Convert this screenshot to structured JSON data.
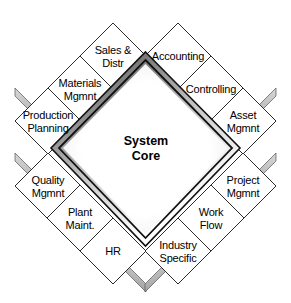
{
  "diagram": {
    "type": "diamond-module-map",
    "core": {
      "label": "System\nCore",
      "line1": "System",
      "line2": "Core"
    },
    "colors": {
      "tile_fill": "#ffffff",
      "tile_stroke": "#2b2b2b",
      "extrusion_light": "#c8c8c8",
      "extrusion_dark": "#8a8a8a",
      "core_border_dark": "#1a1a1a",
      "core_bevel_gray": "#6e6e6e",
      "core_fill": "#ffffff",
      "text": "#000000",
      "background": "#ffffff"
    },
    "modules": [
      {
        "id": "sales-distr",
        "label": "Sales &\nDistr",
        "cx": 113,
        "cy": 56,
        "position": "top-left"
      },
      {
        "id": "accounting",
        "label": "Accounting",
        "cx": 178,
        "cy": 56,
        "position": "top-right"
      },
      {
        "id": "materials-mgmnt",
        "label": "Materials\nMgmnt",
        "cx": 80,
        "cy": 89,
        "position": "upper-left"
      },
      {
        "id": "controlling",
        "label": "Controlling",
        "cx": 211,
        "cy": 89,
        "position": "upper-right"
      },
      {
        "id": "production-planning",
        "label": "Production\nPlanning",
        "cx": 48,
        "cy": 121,
        "position": "left-upper"
      },
      {
        "id": "asset-mgmnt",
        "label": "Asset\nMgmnt",
        "cx": 243,
        "cy": 121,
        "position": "right-upper"
      },
      {
        "id": "quality-mgmnt",
        "label": "Quality\nMgmnt",
        "cx": 48,
        "cy": 186,
        "position": "left-lower"
      },
      {
        "id": "project-mgmnt",
        "label": "Project\nMgmnt",
        "cx": 243,
        "cy": 186,
        "position": "right-lower"
      },
      {
        "id": "plant-maint",
        "label": "Plant\nMaint.",
        "cx": 80,
        "cy": 218,
        "position": "lower-left"
      },
      {
        "id": "work-flow",
        "label": "Work\nFlow",
        "cx": 211,
        "cy": 218,
        "position": "lower-right"
      },
      {
        "id": "hr",
        "label": "HR",
        "cx": 113,
        "cy": 251,
        "position": "bottom-left"
      },
      {
        "id": "industry-specific",
        "label": "Industry\nSpecific",
        "cx": 178,
        "cy": 251,
        "position": "bottom-right"
      }
    ]
  }
}
